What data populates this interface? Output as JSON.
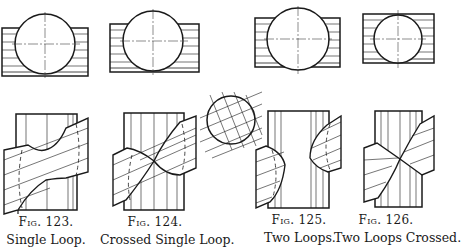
{
  "figures": [
    {
      "number": "Fig. 123.",
      "title": "Single Loop."
    },
    {
      "number": "Fig. 124.",
      "title": "Crossed Single Loop."
    },
    {
      "number": "Fig. 125.",
      "title": "Two Loops."
    },
    {
      "number": "Fig. 126.",
      "title": "Two Loops Crossed."
    }
  ],
  "colors": {
    "ink": "#1a1a1a",
    "paper": "#ffffff"
  }
}
